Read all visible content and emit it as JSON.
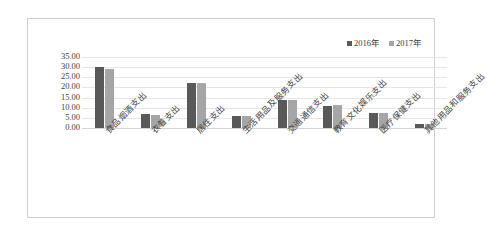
{
  "chart_data": {
    "type": "bar",
    "title": "",
    "subtitle": "",
    "xlabel": "",
    "ylabel": "",
    "ylim": [
      0,
      35
    ],
    "ytick_step": 5,
    "grid": true,
    "legend_position": "top-right",
    "categories": [
      "食品烟酒支出",
      "衣着支出",
      "居住支出",
      "生活用品及服务支出",
      "交通通信支出",
      "教育文化娱乐支出",
      "医疗保健支出",
      "其他用品和服务支出"
    ],
    "ytick_labels": [
      "35.00",
      "30.00",
      "25.00",
      "20.00",
      "15.00",
      "10.00",
      "5.00",
      "0.00"
    ],
    "series": [
      {
        "name": "2016年",
        "color": "#595959",
        "values": [
          29.9,
          6.9,
          22.0,
          6.1,
          13.7,
          11.0,
          7.5,
          2.0
        ]
      },
      {
        "name": "2017年",
        "color": "#a6a6a6",
        "values": [
          29.0,
          6.6,
          22.3,
          6.1,
          13.6,
          11.2,
          7.6,
          2.0
        ]
      }
    ]
  },
  "legend": {
    "items": [
      {
        "label": "2016年",
        "color": "#595959"
      },
      {
        "label": "2017年",
        "color": "#a6a6a6"
      }
    ]
  },
  "colors": {
    "series_2016": "#595959",
    "series_2017": "#a6a6a6",
    "gridline": "#e6e6e6",
    "border": "#d0d0d0",
    "text": "#3a3a3a",
    "background": "#ffffff"
  }
}
